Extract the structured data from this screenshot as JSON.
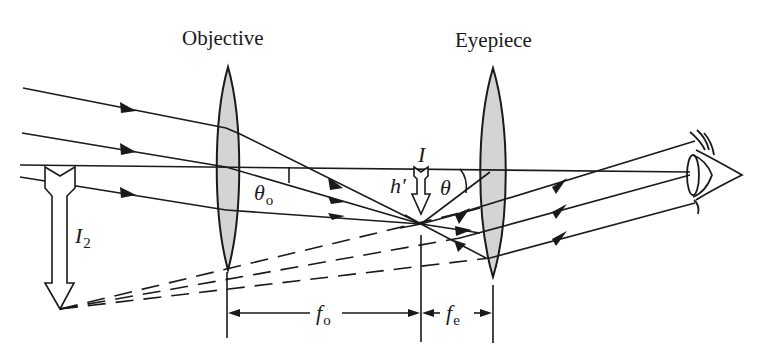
{
  "figure": {
    "labels": {
      "objective": "Objective",
      "eyepiece": "Eyepiece",
      "intermediate_image": "I",
      "final_image": "I",
      "final_image_subscript": "2",
      "image_height": "h′",
      "angle_eyepiece": "θ",
      "angle_objective": "θ",
      "angle_objective_subscript": "o",
      "focal_objective": "f",
      "focal_objective_subscript": "o",
      "focal_eyepiece": "f",
      "focal_eyepiece_subscript": "e"
    },
    "colors": {
      "line": "#1a1a1a",
      "lens_fill": "#d4d4d4",
      "background": "#ffffff"
    },
    "elements": {
      "lenses": [
        "objective-lens",
        "eyepiece-lens"
      ],
      "incoming_rays": 3,
      "outgoing_rays": 3,
      "virtual_rays_dashed": 3,
      "observer": "eye"
    }
  }
}
